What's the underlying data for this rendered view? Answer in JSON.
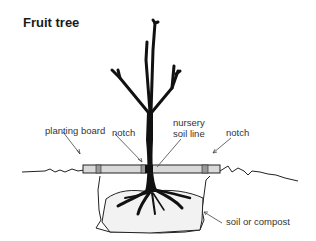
{
  "title": "Fruit tree",
  "labels": {
    "planting_board": "planting board",
    "notch_left": "notch",
    "nursery_line1": "nursery",
    "nursery_line2": "soil line",
    "notch_right": "notch",
    "soil": "soil or compost"
  },
  "colors": {
    "ink": "#111111",
    "board_fill": "#d9d9d9",
    "notch_fill": "#9a9a9a",
    "soil_fill": "#f2f2f2"
  }
}
